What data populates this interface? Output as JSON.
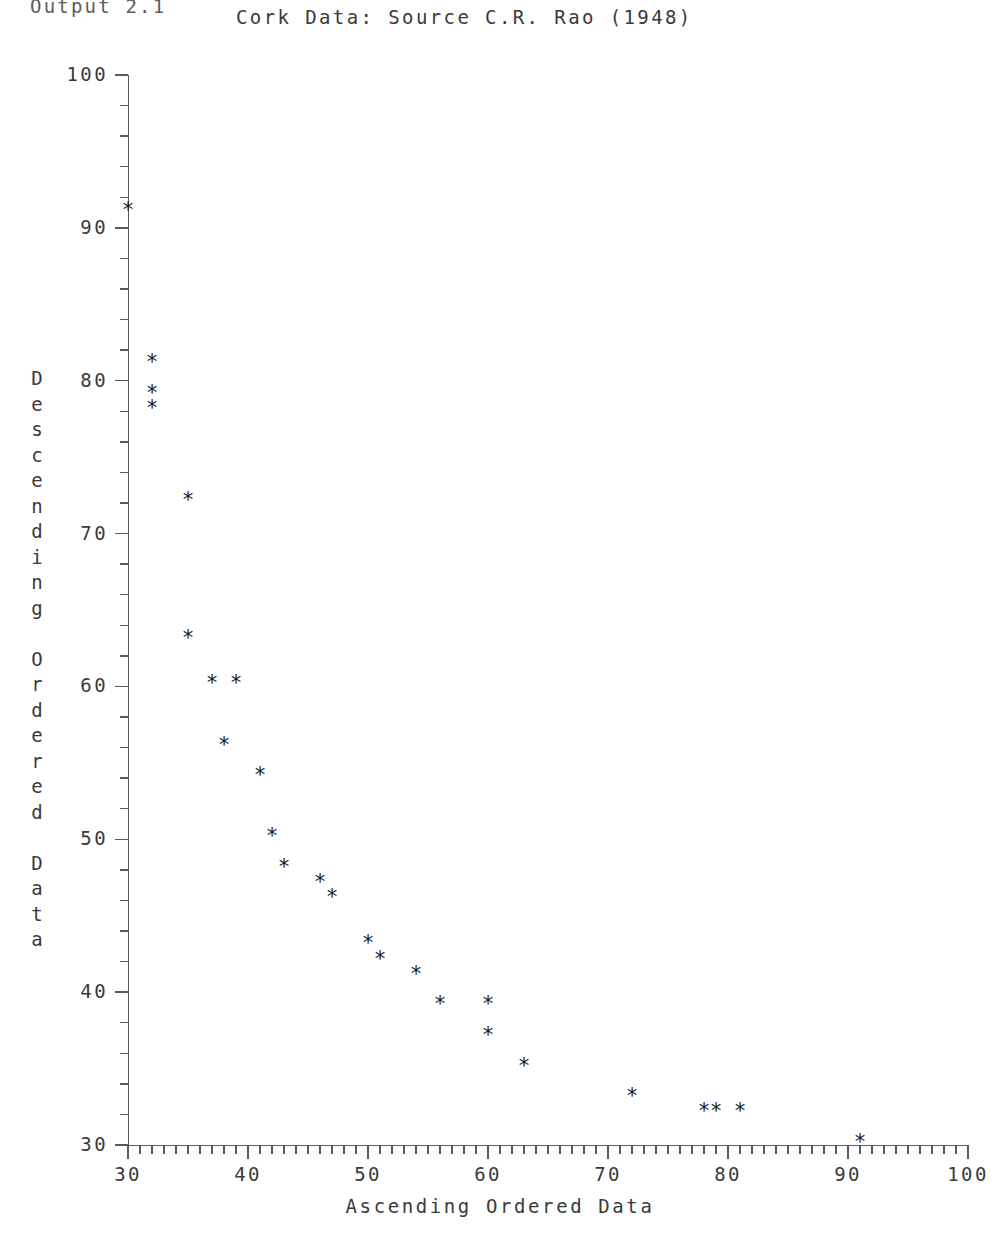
{
  "page": {
    "output_label": "Output 2.1"
  },
  "chart_data": {
    "type": "scatter",
    "title": "Cork Data: Source C.R. Rao (1948)",
    "xlabel": "Ascending Ordered Data",
    "ylabel": "Descending Ordered Data",
    "ylabel_chars": [
      "D",
      "e",
      "s",
      "c",
      "e",
      "n",
      "d",
      "i",
      "n",
      "g",
      "",
      "O",
      "r",
      "d",
      "e",
      "r",
      "e",
      "d",
      "",
      "D",
      "a",
      "t",
      "a"
    ],
    "xlim": [
      30,
      100
    ],
    "ylim": [
      30,
      100
    ],
    "grid": false,
    "legend": null,
    "marker_symbol": "*",
    "marker_color": "#1a1a1a",
    "axis_color": "#5a5a5a",
    "x_major_ticks": [
      30,
      40,
      50,
      60,
      70,
      80,
      90,
      100
    ],
    "x_major_labels": [
      "30",
      "40",
      "50",
      "60",
      "70",
      "80",
      "90",
      "100"
    ],
    "x_minor_step": 1,
    "y_major_ticks": [
      30,
      40,
      50,
      60,
      70,
      80,
      90,
      100
    ],
    "y_major_labels": [
      "30",
      "40",
      "50",
      "60",
      "70",
      "80",
      "90",
      "100"
    ],
    "y_minor_step": 2,
    "x": [
      30,
      32,
      32,
      32,
      35,
      35,
      37,
      39,
      38,
      41,
      42,
      43,
      46,
      47,
      50,
      51,
      54,
      56,
      60,
      60,
      63,
      72,
      78,
      79,
      81,
      91
    ],
    "y": [
      91,
      81,
      79,
      78,
      72,
      63,
      60,
      60,
      56,
      54,
      50,
      48,
      47,
      46,
      43,
      42,
      41,
      39,
      39,
      37,
      35,
      33,
      32,
      32,
      32,
      30
    ],
    "points": [
      {
        "x": 30,
        "y": 91
      },
      {
        "x": 32,
        "y": 81
      },
      {
        "x": 32,
        "y": 79
      },
      {
        "x": 32,
        "y": 78
      },
      {
        "x": 35,
        "y": 72
      },
      {
        "x": 35,
        "y": 63
      },
      {
        "x": 37,
        "y": 60
      },
      {
        "x": 39,
        "y": 60
      },
      {
        "x": 38,
        "y": 56
      },
      {
        "x": 41,
        "y": 54
      },
      {
        "x": 42,
        "y": 50
      },
      {
        "x": 43,
        "y": 48
      },
      {
        "x": 46,
        "y": 47
      },
      {
        "x": 47,
        "y": 46
      },
      {
        "x": 50,
        "y": 43
      },
      {
        "x": 51,
        "y": 42
      },
      {
        "x": 54,
        "y": 41
      },
      {
        "x": 56,
        "y": 39
      },
      {
        "x": 60,
        "y": 39
      },
      {
        "x": 60,
        "y": 37
      },
      {
        "x": 63,
        "y": 35
      },
      {
        "x": 72,
        "y": 33
      },
      {
        "x": 78,
        "y": 32
      },
      {
        "x": 79,
        "y": 32
      },
      {
        "x": 81,
        "y": 32
      },
      {
        "x": 91,
        "y": 30
      }
    ]
  }
}
